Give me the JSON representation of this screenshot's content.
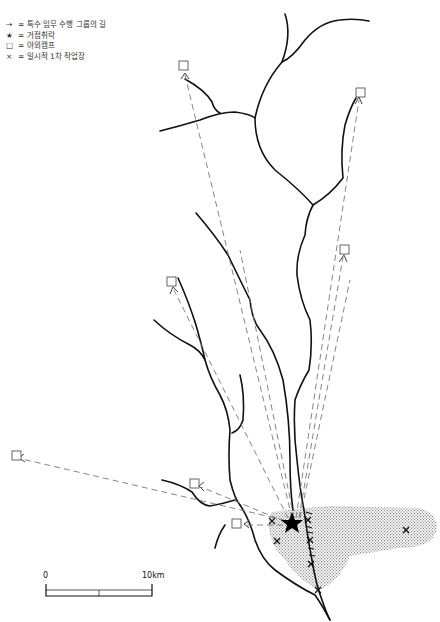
{
  "legend": {
    "items": [
      {
        "symbol": "dashed-arrow",
        "glyph": "⇢",
        "label": "= 특수 임무 수행 그룹의 길"
      },
      {
        "symbol": "star",
        "glyph": "★",
        "label": "= 거점취락"
      },
      {
        "symbol": "square",
        "glyph": "□",
        "label": "= 야외캠프"
      },
      {
        "symbol": "cross",
        "glyph": "×",
        "label": "= 일시적 1차 작업장"
      }
    ]
  },
  "scale": {
    "start_label": "0",
    "end_label": "10km"
  },
  "colors": {
    "river": "#111111",
    "path": "#777777",
    "stipple": "#888888",
    "camp": "#555555"
  },
  "base": {
    "x": 292,
    "y": 524
  },
  "camps": [
    {
      "x": 184,
      "y": 66
    },
    {
      "x": 360,
      "y": 92
    },
    {
      "x": 344,
      "y": 250
    },
    {
      "x": 171,
      "y": 282
    },
    {
      "x": 16,
      "y": 456
    },
    {
      "x": 194,
      "y": 484
    },
    {
      "x": 236,
      "y": 524
    }
  ],
  "workshops": [
    {
      "x": 272,
      "y": 521
    },
    {
      "x": 277,
      "y": 541
    },
    {
      "x": 406,
      "y": 530
    },
    {
      "x": 308,
      "y": 520
    },
    {
      "x": 310,
      "y": 540
    },
    {
      "x": 311,
      "y": 564
    },
    {
      "x": 318,
      "y": 590
    }
  ]
}
